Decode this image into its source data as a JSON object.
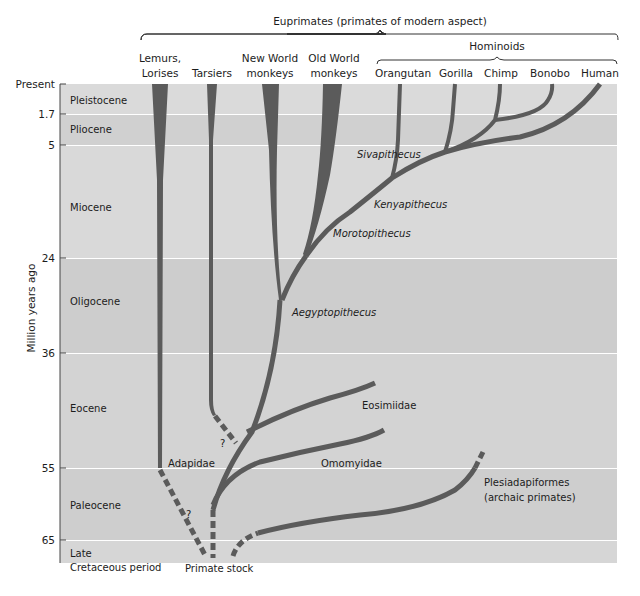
{
  "title": "Euprimates (primates of modern aspect)",
  "group_hominoids": "Hominoids",
  "y_axis_label": "Million years ago",
  "taxa": [
    {
      "line1": "Lemurs,",
      "line2": "Lorises"
    },
    {
      "line1": "",
      "line2": "Tarsiers"
    },
    {
      "line1": "New World",
      "line2": "monkeys"
    },
    {
      "line1": "Old World",
      "line2": "monkeys"
    },
    {
      "line1": "",
      "line2": "Orangutan"
    },
    {
      "line1": "",
      "line2": "Gorilla"
    },
    {
      "line1": "",
      "line2": "Chimp"
    },
    {
      "line1": "",
      "line2": "Bonobo"
    },
    {
      "line1": "",
      "line2": "Human"
    }
  ],
  "time_ticks": [
    "Present",
    "1.7",
    "5",
    "24",
    "36",
    "55",
    "65"
  ],
  "epochs": [
    {
      "name": "Pleistocene",
      "line2": ""
    },
    {
      "name": "Pliocene",
      "line2": ""
    },
    {
      "name": "Miocene",
      "line2": ""
    },
    {
      "name": "Oligocene",
      "line2": ""
    },
    {
      "name": "Eocene",
      "line2": ""
    },
    {
      "name": "Paleocene",
      "line2": ""
    },
    {
      "name": "Late",
      "line2": "Cretaceous period"
    }
  ],
  "fossil_labels": {
    "sivapithecus": "Sivapithecus",
    "kenyapithecus": "Kenyapithecus",
    "morotopithecus": "Morotopithecus",
    "aegyptopithecus": "Aegyptopithecus",
    "eosimiidae": "Eosimiidae",
    "omomyidae": "Omomyidae",
    "adapidae": "Adapidae",
    "plesiadapiformes_1": "Plesiadapiformes",
    "plesiadapiformes_2": "(archaic primates)",
    "primate_stock": "Primate stock",
    "question_1": "?",
    "question_2": "?"
  },
  "colors": {
    "branch": "#5b5b5b",
    "band_light": "#dcdcdc",
    "band_mid": "#d2d2d2",
    "band_dark": "#c8c8c8"
  }
}
